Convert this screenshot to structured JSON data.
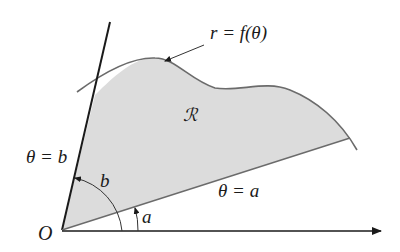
{
  "diagram": {
    "curve_label": "r = f(θ)",
    "region_label": "ℛ",
    "line_b_label": "θ = b",
    "line_a_label": "θ = a",
    "angle_b_label": "b",
    "angle_a_label": "a",
    "origin_label": "O",
    "colors": {
      "region_fill": "#dcdcdc",
      "curve": "#6b6b6b",
      "axis": "#1a1a1a"
    }
  }
}
